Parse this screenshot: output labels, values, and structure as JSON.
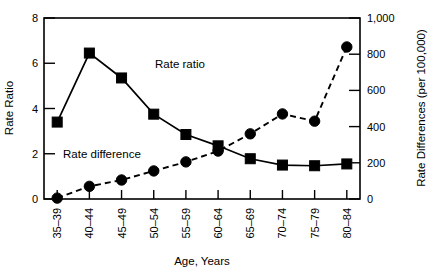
{
  "chart_data": {
    "type": "line",
    "title": "",
    "xlabel": "Age, Years",
    "ylabel": "Rate Ratio",
    "y2label": "Rate Differences (per 100,000)",
    "categories": [
      "35–39",
      "40–44",
      "45–49",
      "50–54",
      "55–59",
      "60–64",
      "65–69",
      "70–74",
      "75–79",
      "80–84"
    ],
    "ylim": [
      0,
      8
    ],
    "y2lim": [
      0,
      1000
    ],
    "yticks": [
      "0",
      "2",
      "4",
      "6",
      "8"
    ],
    "ytick_values": [
      0,
      2,
      4,
      6,
      8
    ],
    "y2ticks": [
      "0",
      "200",
      "400",
      "600",
      "800",
      "1,000"
    ],
    "y2tick_values": [
      0,
      200,
      400,
      600,
      800,
      1000
    ],
    "grid": false,
    "legend": "inline-annotations",
    "series": [
      {
        "name": "Rate ratio",
        "axis": "left",
        "marker": "square",
        "linestyle": "solid",
        "color": "#000000",
        "values": [
          3.4,
          6.45,
          5.35,
          3.75,
          2.85,
          2.35,
          1.78,
          1.5,
          1.47,
          1.55
        ]
      },
      {
        "name": "Rate difference",
        "axis": "right",
        "marker": "circle",
        "linestyle": "dashed",
        "color": "#000000",
        "values": [
          5,
          70,
          105,
          155,
          205,
          265,
          360,
          470,
          430,
          840
        ]
      }
    ],
    "annotations": [
      {
        "text": "Rate ratio",
        "x": 155,
        "y": 68
      },
      {
        "text": "Rate difference",
        "x": 63,
        "y": 158
      }
    ]
  }
}
